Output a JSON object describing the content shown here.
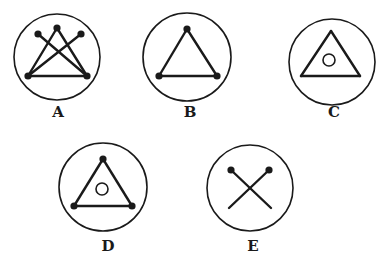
{
  "figures": [
    {
      "id": "A",
      "label": "A",
      "circle": {
        "cx": 57,
        "cy": 57,
        "r": 43
      },
      "points": [
        [
          28,
          76
        ],
        [
          57,
          28
        ],
        [
          87,
          76
        ],
        [
          38,
          34
        ],
        [
          81,
          34
        ]
      ],
      "lines": [
        [
          [
            28,
            76
          ],
          [
            57,
            28
          ]
        ],
        [
          [
            57,
            28
          ],
          [
            87,
            76
          ]
        ],
        [
          [
            28,
            76
          ],
          [
            87,
            76
          ]
        ],
        [
          [
            38,
            34
          ],
          [
            87,
            76
          ]
        ],
        [
          [
            81,
            34
          ],
          [
            28,
            76
          ]
        ]
      ],
      "dots": [
        [
          28,
          76
        ],
        [
          57,
          28
        ],
        [
          87,
          76
        ],
        [
          38,
          34
        ],
        [
          81,
          34
        ]
      ],
      "inner_circle": null,
      "label_pos": [
        58,
        117
      ]
    },
    {
      "id": "B",
      "label": "B",
      "circle": {
        "cx": 187,
        "cy": 57,
        "r": 44
      },
      "lines": [
        [
          [
            159,
            76
          ],
          [
            187,
            29
          ]
        ],
        [
          [
            187,
            29
          ],
          [
            217,
            76
          ]
        ],
        [
          [
            159,
            76
          ],
          [
            217,
            76
          ]
        ]
      ],
      "dots": [
        [
          159,
          76
        ],
        [
          187,
          29
        ],
        [
          217,
          76
        ]
      ],
      "inner_circle": null,
      "label_pos": [
        190,
        117
      ]
    },
    {
      "id": "C",
      "label": "C",
      "circle": {
        "cx": 332,
        "cy": 62,
        "r": 43
      },
      "lines": [
        [
          [
            301,
            76
          ],
          [
            331,
            31
          ]
        ],
        [
          [
            331,
            31
          ],
          [
            360,
            76
          ]
        ],
        [
          [
            301,
            76
          ],
          [
            360,
            76
          ]
        ]
      ],
      "dots": [],
      "inner_circle": {
        "cx": 329,
        "cy": 60,
        "r": 6
      },
      "label_pos": [
        334,
        117
      ]
    },
    {
      "id": "D",
      "label": "D",
      "circle": {
        "cx": 103,
        "cy": 187,
        "r": 44
      },
      "lines": [
        [
          [
            74,
            206
          ],
          [
            103,
            159
          ]
        ],
        [
          [
            103,
            159
          ],
          [
            132,
            206
          ]
        ],
        [
          [
            74,
            206
          ],
          [
            132,
            206
          ]
        ]
      ],
      "dots": [
        [
          74,
          206
        ],
        [
          103,
          159
        ],
        [
          132,
          206
        ]
      ],
      "inner_circle": {
        "cx": 102,
        "cy": 189,
        "r": 6
      },
      "label_pos": [
        108,
        251
      ]
    },
    {
      "id": "E",
      "label": "E",
      "circle": {
        "cx": 250,
        "cy": 188,
        "r": 43
      },
      "lines": [
        [
          [
            231,
            170
          ],
          [
            271,
            208
          ]
        ],
        [
          [
            269,
            170
          ],
          [
            229,
            208
          ]
        ]
      ],
      "dots": [
        [
          231,
          170
        ],
        [
          269,
          170
        ]
      ],
      "inner_circle": null,
      "label_pos": [
        253,
        251
      ]
    }
  ],
  "colors": {
    "stroke": "#1a1a1a",
    "background": "#ffffff"
  }
}
